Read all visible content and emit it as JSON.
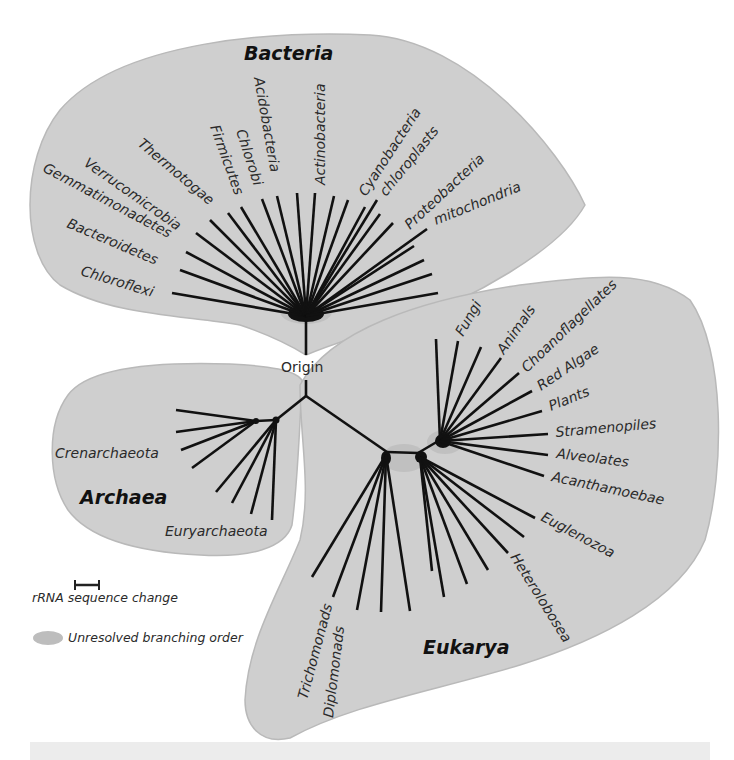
{
  "origin_label": "Origin",
  "domains": {
    "bacteria": {
      "name": "Bacteria",
      "groups": [
        "Chloroflexi",
        "Bacteroidetes",
        "Gemmatimonadetes",
        "Verrucomicrobia",
        "Thermotogae",
        "Firmicutes",
        "Chlorobi",
        "Acidobacteria",
        "Actinobacteria",
        "Cyanobacteria",
        "chloroplasts",
        "Proteobacteria",
        "mitochondria"
      ]
    },
    "archaea": {
      "name": "Archaea",
      "groups": [
        "Crenarchaeota",
        "Euryarchaeota"
      ]
    },
    "eukarya": {
      "name": "Eukarya",
      "groups": [
        "Fungi",
        "Animals",
        "Choanoflagellates",
        "Red Algae",
        "Plants",
        "Stramenopiles",
        "Alveolates",
        "Acanthamoebae",
        "Euglenozoa",
        "Heterolobosea",
        "Trichomonads",
        "Diplomonads"
      ]
    }
  },
  "legend": {
    "scale_bar_label": "rRNA sequence change",
    "unresolved_label": "Unresolved branching order"
  },
  "colors": {
    "domain_fill": "#cfcfcf",
    "branch": "#111111",
    "text": "#2a2a2a"
  }
}
